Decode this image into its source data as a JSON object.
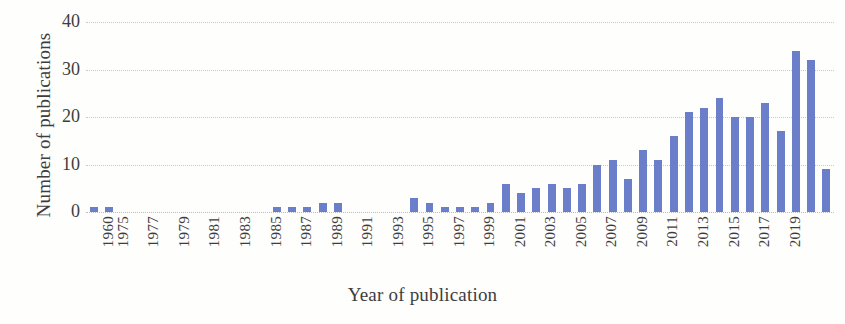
{
  "chart_data": {
    "type": "bar",
    "title": "",
    "xlabel": "Year of publication",
    "ylabel": "Number of publications",
    "ylim": [
      0,
      40
    ],
    "yticks": [
      0,
      10,
      20,
      30,
      40
    ],
    "grid": true,
    "legend": "none",
    "bar_color": "#6b7ec9",
    "categories": [
      "1960",
      "1975",
      "1976",
      "1977",
      "1978",
      "1979",
      "1980",
      "1981",
      "1982",
      "1983",
      "1984",
      "1985",
      "1986",
      "1987",
      "1988",
      "1989",
      "1990",
      "1991",
      "1992",
      "1993",
      "1994",
      "1995",
      "1996",
      "1997",
      "1998",
      "1999",
      "2000",
      "2001",
      "2002",
      "2003",
      "2004",
      "2005",
      "2006",
      "2007",
      "2008",
      "2009",
      "2010",
      "2011",
      "2012",
      "2013",
      "2014",
      "2015",
      "2016",
      "2017",
      "2018",
      "2019"
    ],
    "values": [
      1,
      1,
      0,
      0,
      0,
      0,
      0,
      0,
      0,
      0,
      0,
      0,
      1,
      1,
      1,
      2,
      2,
      0,
      0,
      0,
      0,
      3,
      2,
      1,
      1,
      1,
      2,
      6,
      4,
      5,
      6,
      5,
      6,
      10,
      11,
      7,
      13,
      11,
      16,
      21,
      22,
      24,
      20,
      20,
      23,
      17
    ],
    "visible_tick_labels": [
      "1960",
      "1975",
      "1977",
      "1979",
      "1981",
      "1983",
      "1985",
      "1987",
      "1989",
      "1991",
      "1993",
      "1995",
      "1997",
      "1999",
      "2001",
      "2003",
      "2005",
      "2007",
      "2009",
      "2011",
      "2013",
      "2015",
      "2017",
      "2019"
    ],
    "tail_values": [
      34,
      32,
      9
    ]
  },
  "axes": {
    "y_title": "Number of publications",
    "x_title": "Year of publication"
  }
}
